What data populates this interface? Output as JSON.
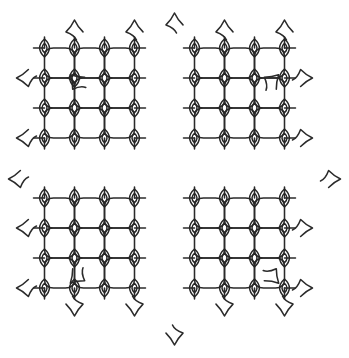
{
  "artwork": {
    "title": "Kolam lattice mandala",
    "kind": "line-drawing",
    "symmetry": "4-fold rotational (C4), octagonal silhouette",
    "background_color": "#ffffff",
    "line_color": "#2b2b2b",
    "line_width": 1.55,
    "canvas": {
      "width": 349,
      "height": 358
    }
  },
  "geometry": {
    "grid_pitch": 30,
    "origin_x": 14.5,
    "origin_y": 18.0,
    "columns": 11,
    "rows": 11,
    "center_x": 174.5,
    "center_y": 179.0,
    "corner_radius": 9,
    "eye_rx": 6.5,
    "eye_ry": 9.0,
    "eye_inner_scale": 0.52,
    "flourish_length": 17
  },
  "regions": {
    "orthogonal_blocks": [
      {
        "name": "top-left-block",
        "col_start": 1,
        "col_end": 4,
        "row_start": 1,
        "row_end": 4
      },
      {
        "name": "top-right-block",
        "col_start": 6,
        "col_end": 9,
        "row_start": 1,
        "row_end": 4
      },
      {
        "name": "bottom-left-block",
        "col_start": 1,
        "col_end": 4,
        "row_start": 6,
        "row_end": 9
      },
      {
        "name": "bottom-right-block",
        "col_start": 6,
        "col_end": 9,
        "row_start": 6,
        "row_end": 9
      }
    ],
    "diagonal_bands": [
      {
        "name": "north-band",
        "orientation": "diagonal"
      },
      {
        "name": "east-band",
        "orientation": "diagonal"
      },
      {
        "name": "south-band",
        "orientation": "diagonal"
      },
      {
        "name": "west-band",
        "orientation": "diagonal"
      }
    ],
    "center_void": {
      "name": "octagonal-hollow-center",
      "radius": 52
    }
  },
  "counts": {
    "orthogonal_blocks": 4,
    "diagonal_bands": 4,
    "eye_loops_total": 88,
    "perimeter_flourishes": 20
  },
  "labels": {
    "figure_caption": ""
  }
}
